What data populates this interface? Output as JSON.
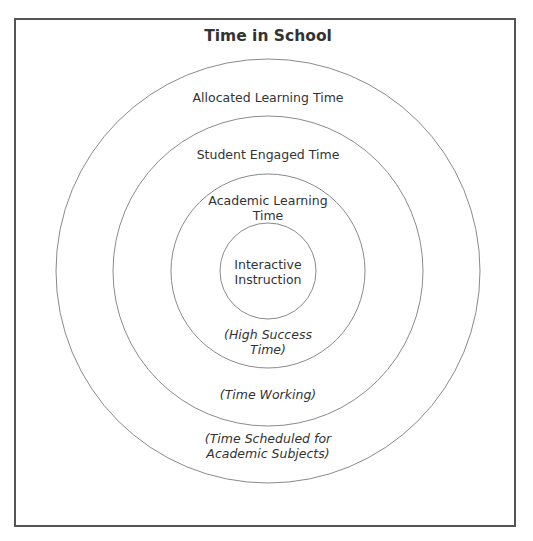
{
  "diagram": {
    "title": "Time in School",
    "type": "concentric-circles",
    "center": [
      268,
      271
    ],
    "rings": [
      {
        "name": "allocated",
        "radius": 212,
        "label": "Allocated Learning Time",
        "sublabel_line1": "(Time Scheduled for",
        "sublabel_line2": "Academic Subjects)"
      },
      {
        "name": "engaged",
        "radius": 155,
        "label": "Student Engaged Time",
        "sublabel_line1": "(Time Working)"
      },
      {
        "name": "academic",
        "radius": 97,
        "label_line1": "Academic Learning",
        "label_line2": "Time",
        "sublabel_line1": "(High Success",
        "sublabel_line2": "Time)"
      },
      {
        "name": "interactive",
        "radius": 48,
        "label_line1": "Interactive",
        "label_line2": "Instruction"
      }
    ],
    "colors": {
      "stroke": "#888888",
      "frame": "#555555",
      "text": "#333333"
    }
  }
}
